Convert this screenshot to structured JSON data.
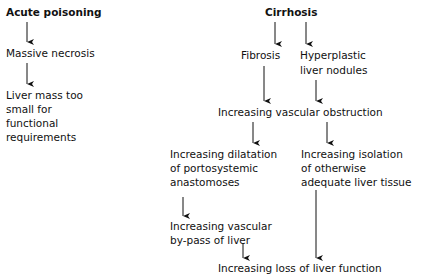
{
  "left_column": {
    "title": "Acute poisoning",
    "step1": "Massive necrosis",
    "step2_lines": [
      "Liver mass too",
      "small for",
      "functional",
      "requirements"
    ]
  },
  "right_column": {
    "title": "Cirrhosis",
    "fibrosis": "Fibrosis",
    "nodules_lines": [
      "Hyperplastic",
      "liver nodules"
    ],
    "obstruction": "Increasing vascular obstruction",
    "dilatation_lines": [
      "Increasing dilatation",
      "of portosystemic",
      "anastomoses"
    ],
    "isolation_lines": [
      "Increasing isolation",
      "of otherwise",
      "adequate liver tissue"
    ],
    "bypass_lines": [
      "Increasing vascular",
      "by-pass of liver"
    ],
    "loss": "Increasing loss of liver function"
  }
}
